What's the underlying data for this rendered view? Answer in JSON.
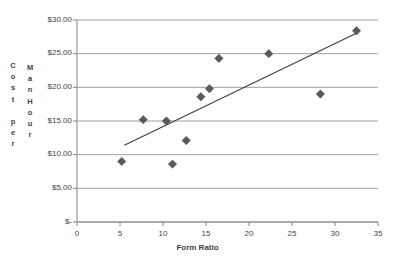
{
  "chart_data": {
    "type": "scatter",
    "title": "",
    "xlabel": "Form Ratio",
    "ylabel": "Cost per Man Hour",
    "ylabel_columns": [
      "C\no\ns\nt\n \np\ne\nr",
      "M\na\nn\nH\no\nu\nr"
    ],
    "xlim": [
      0,
      35
    ],
    "ylim": [
      0,
      30
    ],
    "xticks": [
      0,
      5,
      10,
      15,
      20,
      25,
      30,
      35
    ],
    "xtick_labels": [
      "0",
      "5",
      "10",
      "15",
      "20",
      "25",
      "30",
      "35"
    ],
    "yticks": [
      0,
      5,
      10,
      15,
      20,
      25,
      30
    ],
    "ytick_labels": [
      "$-",
      "$5.00",
      "$10.00",
      "$15.00",
      "$20.00",
      "$25.00",
      "$30.00"
    ],
    "grid": "horizontal",
    "legend": "none",
    "marker": "diamond",
    "marker_color": "#595959",
    "gridline_color": "#868686",
    "axis_color": "#868686",
    "trendline_color": "#404040",
    "series": [
      {
        "name": "Cost per Man Hour",
        "points": [
          {
            "x": 5.2,
            "y": 9.0
          },
          {
            "x": 7.7,
            "y": 15.2
          },
          {
            "x": 10.4,
            "y": 15.0
          },
          {
            "x": 11.1,
            "y": 8.6
          },
          {
            "x": 12.7,
            "y": 12.1
          },
          {
            "x": 14.4,
            "y": 18.6
          },
          {
            "x": 15.4,
            "y": 19.8
          },
          {
            "x": 16.5,
            "y": 24.3
          },
          {
            "x": 22.3,
            "y": 25.0
          },
          {
            "x": 28.3,
            "y": 19.0
          },
          {
            "x": 32.5,
            "y": 28.4
          }
        ]
      }
    ],
    "trendline": {
      "name": "Linear trendline",
      "x_start": 5.5,
      "y_start": 11.4,
      "x_end": 32.6,
      "y_end": 28.1
    }
  }
}
